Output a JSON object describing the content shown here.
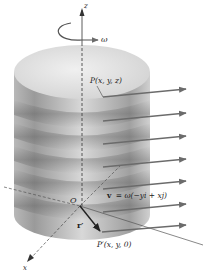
{
  "figure": {
    "labels": {
      "z_axis": "z",
      "x_axis": "x",
      "omega": "ω",
      "origin": "O",
      "point_P": "P(x, y, z)",
      "point_P_prime": "P′(x, y, 0)",
      "r_prime": "r′",
      "velocity_v": "v",
      "velocity_eq": "= ω(−yi + xj)"
    },
    "colors": {
      "arrow": "#6b6b6b",
      "axis": "#555555",
      "cylinder_light": "#e6e6e6",
      "cylinder_dark": "#8a8a8a",
      "r_vector": "#222222"
    },
    "velocity_arrow_count": 7
  }
}
